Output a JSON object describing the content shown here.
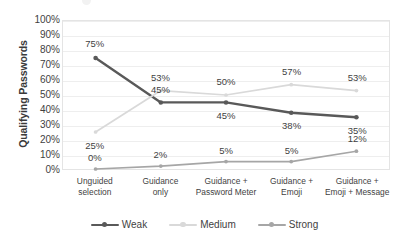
{
  "axis": {
    "y_title": "Qualifying Passwords",
    "y_ticks": [
      "100%",
      "90%",
      "80%",
      "70%",
      "60%",
      "50%",
      "40%",
      "30%",
      "20%",
      "10%",
      "0%"
    ]
  },
  "legend": {
    "items": [
      {
        "label": "Weak",
        "color": "#595959",
        "marker": "weak-legend-marker"
      },
      {
        "label": "Medium",
        "color": "#d9d9d9",
        "marker": "medium-legend-marker"
      },
      {
        "label": "Strong",
        "color": "#a6a6a6",
        "marker": "strong-legend-marker"
      }
    ]
  },
  "categories_display": [
    [
      "Unguided",
      "selection"
    ],
    [
      "Guidance",
      "only"
    ],
    [
      "Guidance +",
      "Password Meter"
    ],
    [
      "Guidance +",
      "Emoji"
    ],
    [
      "Guidance +",
      "Emoji + Message"
    ]
  ],
  "value_labels": {
    "weak": [
      "75%",
      "45%",
      "45%",
      "38%",
      "35%"
    ],
    "medium": [
      "25%",
      "53%",
      "50%",
      "57%",
      "53%"
    ],
    "strong": [
      "0%",
      "2%",
      "5%",
      "5%",
      "12%"
    ]
  },
  "chart_data": {
    "type": "line",
    "title": "",
    "xlabel": "",
    "ylabel": "Qualifying Passwords",
    "ylim": [
      0,
      100
    ],
    "ytick_values": [
      0,
      10,
      20,
      30,
      40,
      50,
      60,
      70,
      80,
      90,
      100
    ],
    "ytick_labels": [
      "0%",
      "10%",
      "20%",
      "30%",
      "40%",
      "50%",
      "60%",
      "70%",
      "80%",
      "90%",
      "100%"
    ],
    "grid": true,
    "legend_position": "bottom",
    "categories": [
      "Unguided selection",
      "Guidance only",
      "Guidance + Password Meter",
      "Guidance + Emoji",
      "Guidance + Emoji + Message"
    ],
    "series": [
      {
        "name": "Weak",
        "color": "#595959",
        "values": [
          75,
          45,
          45,
          38,
          35
        ]
      },
      {
        "name": "Medium",
        "color": "#d9d9d9",
        "values": [
          25,
          53,
          50,
          57,
          53
        ]
      },
      {
        "name": "Strong",
        "color": "#a6a6a6",
        "values": [
          0,
          2,
          5,
          5,
          12
        ]
      }
    ]
  }
}
